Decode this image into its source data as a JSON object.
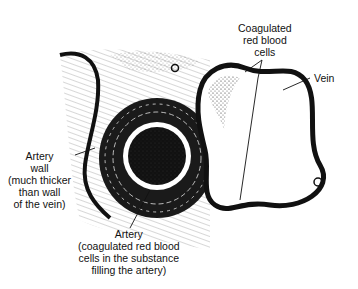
{
  "figure": {
    "labels": {
      "coagulated_cells": [
        "Coagulated",
        "red blood",
        "cells"
      ],
      "vein": "Vein",
      "artery_wall": [
        "Artery",
        "wall",
        "(much thicker",
        "than wall",
        "of the vein)"
      ],
      "artery": [
        "Artery",
        "(coagulated red blood",
        "cells in the substance",
        "filling the artery)"
      ]
    },
    "colors": {
      "ink": "#111111",
      "background": "#ffffff"
    }
  }
}
